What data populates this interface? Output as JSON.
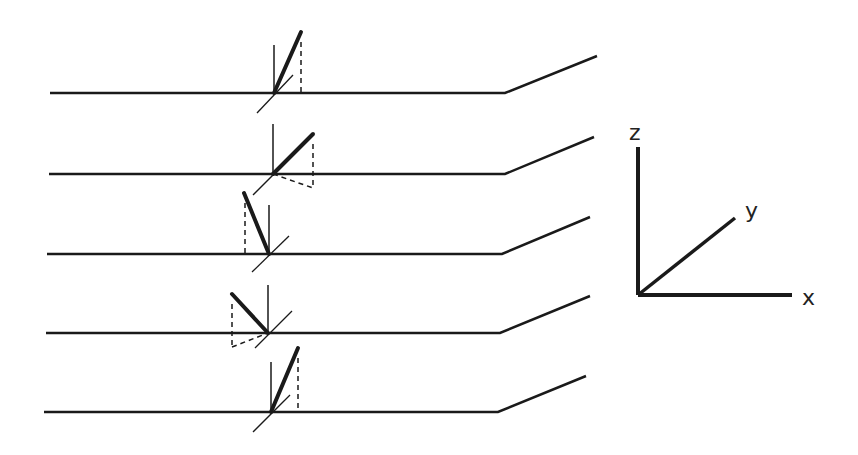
{
  "diagram": {
    "colors": {
      "line": "#1a1a1a",
      "background": "#ffffff"
    },
    "rows": [
      {
        "id": "row-1",
        "baseline_y": 93,
        "left_x": 50,
        "bend_x": 505,
        "end": [
          597,
          56
        ],
        "origin": [
          274,
          93
        ],
        "vertical_top": 45,
        "vector_tip": [
          301,
          32
        ],
        "dash_x": 301,
        "dash_bottom": 93,
        "depth_dash": null,
        "diag": [
          [
            257,
            113
          ],
          [
            293,
            75
          ]
        ]
      },
      {
        "id": "row-2",
        "baseline_y": 174,
        "left_x": 49,
        "bend_x": 505,
        "end": [
          594,
          137
        ],
        "origin": [
          273,
          174
        ],
        "vertical_top": 124,
        "vector_tip": [
          313,
          134
        ],
        "dash_x": 313,
        "dash_bottom": 188,
        "depth_dash": [
          [
            273,
            174
          ],
          [
            313,
            188
          ]
        ],
        "diag": [
          [
            253,
            195
          ],
          [
            291,
            157
          ]
        ]
      },
      {
        "id": "row-3",
        "baseline_y": 254,
        "left_x": 47,
        "bend_x": 502,
        "end": [
          590,
          217
        ],
        "origin": [
          269,
          254
        ],
        "vertical_top": 205,
        "vector_tip": [
          244,
          193
        ],
        "dash_x": 245,
        "dash_bottom": 254,
        "depth_dash": null,
        "diag": [
          [
            252,
            272
          ],
          [
            289,
            236
          ]
        ]
      },
      {
        "id": "row-4",
        "baseline_y": 333,
        "left_x": 46,
        "bend_x": 500,
        "end": [
          590,
          296
        ],
        "origin": [
          268,
          333
        ],
        "vertical_top": 285,
        "vector_tip": [
          232,
          294
        ],
        "dash_x": 232,
        "dash_bottom": 347,
        "depth_dash": [
          [
            232,
            347
          ],
          [
            268,
            333
          ]
        ],
        "diag": [
          [
            255,
            348
          ],
          [
            292,
            311
          ]
        ]
      },
      {
        "id": "row-5",
        "baseline_y": 412,
        "left_x": 44,
        "bend_x": 498,
        "end": [
          586,
          376
        ],
        "origin": [
          271,
          412
        ],
        "vertical_top": 362,
        "vector_tip": [
          298,
          348
        ],
        "dash_x": 298,
        "dash_bottom": 412,
        "depth_dash": null,
        "diag": [
          [
            253,
            432
          ],
          [
            290,
            395
          ]
        ]
      }
    ],
    "axes": {
      "origin": [
        638,
        295
      ],
      "z_end": [
        638,
        147
      ],
      "x_end": [
        792,
        295
      ],
      "y_end": [
        735,
        218
      ],
      "labels": {
        "z": {
          "text": "z",
          "pos": [
            629,
            140
          ]
        },
        "y": {
          "text": "y",
          "pos": [
            745,
            218
          ]
        },
        "x": {
          "text": "x",
          "pos": [
            802,
            305
          ]
        }
      }
    }
  }
}
